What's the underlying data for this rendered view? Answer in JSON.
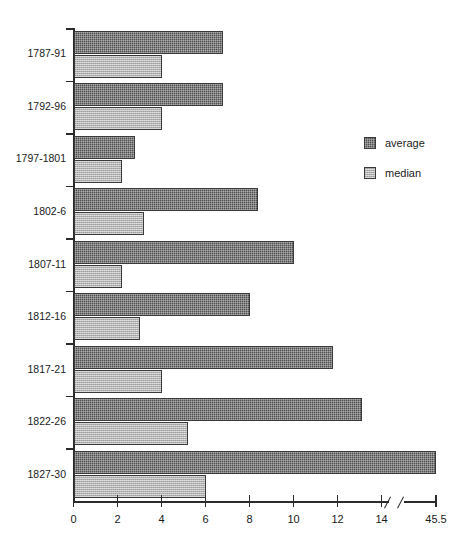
{
  "chart_data": {
    "type": "bar",
    "orientation": "horizontal",
    "title": "",
    "xlabel": "",
    "ylabel": "",
    "grid": false,
    "legend_position": "right",
    "xlim": [
      0,
      45.5
    ],
    "axis_break": {
      "present": true,
      "after_tick": 14,
      "before_tick": 45.5
    },
    "xticks": [
      0,
      2,
      4,
      6,
      8,
      10,
      12,
      14,
      45.5
    ],
    "xtick_labels": [
      "0",
      "2",
      "4",
      "6",
      "8",
      "10",
      "12",
      "14",
      "45.5"
    ],
    "categories": [
      "1787-91",
      "1792-96",
      "1797-1801",
      "1802-6",
      "1807-11",
      "1812-16",
      "1817-21",
      "1822-26",
      "1827-30"
    ],
    "series": [
      {
        "name": "average",
        "color": "#4f4f4f",
        "values": [
          6.8,
          6.8,
          2.8,
          8.4,
          10.0,
          8.0,
          11.8,
          13.1,
          45.5
        ]
      },
      {
        "name": "median",
        "color": "#b3b3b3",
        "values": [
          4.0,
          4.0,
          2.2,
          3.2,
          2.2,
          3.0,
          4.0,
          5.2,
          6.0
        ]
      }
    ]
  },
  "legend": {
    "entries": [
      {
        "label": "average"
      },
      {
        "label": "median"
      }
    ]
  },
  "colors": {
    "average": "#4f4f4f",
    "median": "#b3b3b3",
    "axis": "#2b2b2b",
    "background": "#ffffff"
  }
}
